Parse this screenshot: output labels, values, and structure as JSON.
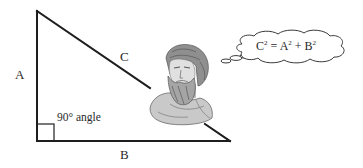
{
  "diagram": {
    "labels": {
      "side_a": "A",
      "side_b": "B",
      "side_c": "C",
      "right_angle": "90° angle"
    },
    "equation": {
      "c": "C",
      "eq": " = ",
      "a": "A",
      "plus": " + ",
      "b": "B",
      "exp": "2",
      "full_text": "C² = A² + B²"
    },
    "figure": "bust-of-pythagoras",
    "colors": {
      "line": "#1e1e1e",
      "text": "#2a2a2a",
      "background": "#ffffff"
    }
  }
}
